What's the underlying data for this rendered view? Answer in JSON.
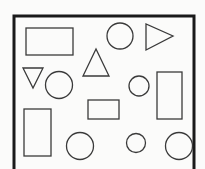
{
  "diagram": {
    "title": "",
    "colors": {
      "frame": "#1a1a1a",
      "stroke": "#3a3a3a",
      "background": "#fbfbfa"
    },
    "shapes": [
      {
        "id": "rect-1",
        "kind": "rectangle",
        "orientation": "horizontal"
      },
      {
        "id": "circle-1",
        "kind": "circle",
        "size": "large"
      },
      {
        "id": "triangle-1",
        "kind": "triangle",
        "orientation": "pointing-right"
      },
      {
        "id": "triangle-2",
        "kind": "triangle",
        "orientation": "pointing-up"
      },
      {
        "id": "triangle-3",
        "kind": "triangle",
        "orientation": "pointing-down"
      },
      {
        "id": "circle-2",
        "kind": "circle",
        "size": "large"
      },
      {
        "id": "circle-3",
        "kind": "circle",
        "size": "small"
      },
      {
        "id": "rect-2",
        "kind": "rectangle",
        "orientation": "vertical"
      },
      {
        "id": "rect-3",
        "kind": "rectangle",
        "orientation": "horizontal"
      },
      {
        "id": "rect-4",
        "kind": "rectangle",
        "orientation": "vertical"
      },
      {
        "id": "circle-4",
        "kind": "circle",
        "size": "large"
      },
      {
        "id": "circle-5",
        "kind": "circle",
        "size": "small"
      },
      {
        "id": "circle-6",
        "kind": "circle",
        "size": "large"
      }
    ],
    "counts": {
      "rectangles": 4,
      "circles": 6,
      "triangles": 3
    }
  }
}
